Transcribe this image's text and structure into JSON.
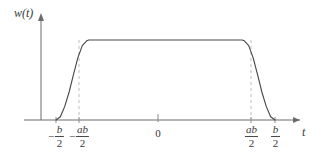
{
  "figure": {
    "background_color": "#ffffff",
    "curve_color": "#4a4a4a",
    "axis_color": "#6b6b6b",
    "dash_color": "#bdbdbd"
  },
  "axes": {
    "y_label": "w(t)",
    "x_label": "t",
    "x_axis_y_px": 120,
    "y_axis_x_px": 41
  },
  "ticks": [
    {
      "id": "neg-b-over-2",
      "minus": "−",
      "numerator": "b",
      "denominator": "2",
      "x_px": 56,
      "type": "fraction"
    },
    {
      "id": "neg-ab-over-2",
      "minus": "−",
      "numerator": "ab",
      "denominator": "2",
      "x_px": 79,
      "type": "fraction"
    },
    {
      "id": "zero",
      "label": "0",
      "x_px": 158,
      "type": "plain"
    },
    {
      "id": "ab-over-2",
      "minus": "",
      "numerator": "ab",
      "denominator": "2",
      "x_px": 251,
      "type": "fraction"
    },
    {
      "id": "b-over-2",
      "minus": "",
      "numerator": "b",
      "denominator": "2",
      "x_px": 275,
      "type": "fraction"
    }
  ],
  "chart_data": {
    "type": "line",
    "title": "",
    "xlabel": "t",
    "ylabel": "w(t)",
    "grid": false,
    "legend": null,
    "xlim": [
      -0.62,
      0.7
    ],
    "ylim": [
      0,
      1.18
    ],
    "xtick_values": [
      -0.5,
      -0.35,
      0,
      0.35,
      0.5
    ],
    "xtick_labels": [
      "-b/2",
      "-ab/2",
      "0",
      "ab/2",
      "b/2"
    ],
    "ytick_values": [],
    "ytick_labels": [],
    "parameters": {
      "b": 1.0,
      "a": 0.7,
      "plateau_value": 1.0
    },
    "series": [
      {
        "name": "w(t)",
        "x": [
          -0.5,
          -0.48,
          -0.46,
          -0.44,
          -0.42,
          -0.4,
          -0.38,
          -0.36,
          -0.35,
          0.35,
          0.36,
          0.38,
          0.4,
          0.42,
          0.44,
          0.46,
          0.48,
          0.5
        ],
        "values": [
          0.0,
          0.04,
          0.17,
          0.35,
          0.57,
          0.78,
          0.93,
          0.99,
          1.0,
          1.0,
          0.99,
          0.93,
          0.78,
          0.57,
          0.35,
          0.17,
          0.04,
          0.0
        ]
      }
    ],
    "annotations": [
      {
        "kind": "dashed-vline",
        "x": -0.35,
        "y_from": 0,
        "y_to": 1.0
      },
      {
        "kind": "dashed-vline",
        "x": 0.35,
        "y_from": 0,
        "y_to": 1.0
      }
    ]
  }
}
